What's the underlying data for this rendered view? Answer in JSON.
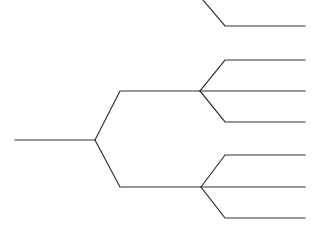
{
  "diagram": {
    "type": "tree",
    "background": "#ffffff",
    "stroke_color": "#333333",
    "edges": [
      {
        "id": "root-stem",
        "points": [
          [
            15,
            140
          ],
          [
            95,
            140
          ]
        ]
      },
      {
        "id": "root-to-upper",
        "points": [
          [
            95,
            140
          ],
          [
            120,
            91
          ],
          [
            200,
            91
          ]
        ]
      },
      {
        "id": "root-to-lower",
        "points": [
          [
            95,
            140
          ],
          [
            120,
            187
          ],
          [
            201,
            187
          ]
        ]
      },
      {
        "id": "top-offscreen",
        "points": [
          [
            203,
            0
          ],
          [
            225,
            26
          ],
          [
            305,
            26
          ]
        ]
      },
      {
        "id": "upper-leaf-1",
        "points": [
          [
            200,
            91
          ],
          [
            225,
            60
          ],
          [
            305,
            60
          ]
        ]
      },
      {
        "id": "upper-leaf-2",
        "points": [
          [
            200,
            91
          ],
          [
            305,
            91
          ]
        ]
      },
      {
        "id": "upper-leaf-3",
        "points": [
          [
            200,
            91
          ],
          [
            225,
            122
          ],
          [
            305,
            122
          ]
        ]
      },
      {
        "id": "lower-leaf-1",
        "points": [
          [
            201,
            187
          ],
          [
            225,
            155
          ],
          [
            305,
            155
          ]
        ]
      },
      {
        "id": "lower-leaf-2",
        "points": [
          [
            201,
            187
          ],
          [
            305,
            187
          ]
        ]
      },
      {
        "id": "lower-leaf-3",
        "points": [
          [
            201,
            187
          ],
          [
            225,
            218
          ],
          [
            305,
            218
          ]
        ]
      }
    ]
  }
}
